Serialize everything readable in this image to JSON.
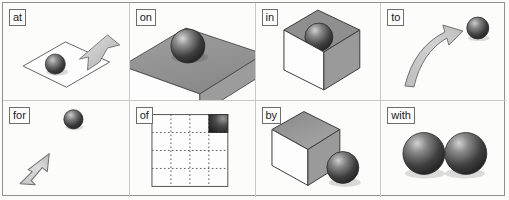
{
  "figure": {
    "layout": {
      "columns": 4,
      "rows": 2,
      "border_color": "#8f8f8f",
      "divider_color": "#c9c9c7",
      "background_color": "#fbfbfa"
    },
    "colors": {
      "sphere_dark": "#3a3a3a",
      "sphere_light": "#d9d9d9",
      "cube_top": "#8e8e8e",
      "cube_right": "#9b9b9b",
      "cube_front": "#fdfdfd",
      "arrow_fill": "#c9c9c9",
      "arrow_stroke": "#6f6f6f",
      "outline": "#4a4a4a",
      "grid_dots": "#7a7a7a"
    },
    "panels": [
      {
        "id": "at",
        "label": "at",
        "row": 1,
        "column": 1,
        "figure_name": "sphere-on-plane-with-pointing-arrow",
        "elements": [
          "plane",
          "sphere",
          "arrow"
        ]
      },
      {
        "id": "on",
        "label": "on",
        "row": 1,
        "column": 2,
        "figure_name": "sphere-resting-on-slab",
        "elements": [
          "slab",
          "sphere"
        ]
      },
      {
        "id": "in",
        "label": "in",
        "row": 1,
        "column": 3,
        "figure_name": "sphere-embedded-in-cube",
        "elements": [
          "cube",
          "sphere"
        ]
      },
      {
        "id": "to",
        "label": "to",
        "row": 1,
        "column": 4,
        "figure_name": "curved-arrow-toward-sphere",
        "elements": [
          "curved-arrow",
          "sphere"
        ]
      },
      {
        "id": "for",
        "label": "for",
        "row": 2,
        "column": 1,
        "figure_name": "arrow-aimed-at-distant-sphere",
        "elements": [
          "arrow",
          "sphere"
        ]
      },
      {
        "id": "of",
        "label": "of",
        "row": 2,
        "column": 2,
        "figure_name": "grid-square-with-highlighted-corner-cell",
        "elements": [
          "grid",
          "highlighted-cell"
        ],
        "grid_cells": 4
      },
      {
        "id": "by",
        "label": "by",
        "row": 2,
        "column": 3,
        "figure_name": "sphere-beside-cube",
        "elements": [
          "cube",
          "sphere"
        ]
      },
      {
        "id": "with",
        "label": "with",
        "row": 2,
        "column": 4,
        "figure_name": "two-adjacent-spheres",
        "elements": [
          "sphere",
          "sphere"
        ]
      }
    ]
  }
}
